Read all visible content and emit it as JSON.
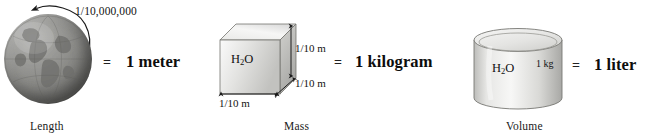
{
  "figure": {
    "background_color": "#ffffff"
  },
  "panels": [
    {
      "id": "length",
      "caption": "Length",
      "icon": "globe-earth",
      "annotation": "1/10,000,000",
      "equals_symbol": "=",
      "result": "1 meter"
    },
    {
      "id": "mass",
      "caption": "Mass",
      "icon": "cube-water",
      "substance": "H",
      "substance_sub": "2",
      "substance_tail": "O",
      "dimension_height": "1/10 m",
      "dimension_depth": "1/10 m",
      "dimension_width": "1/10 m",
      "equals_symbol": "=",
      "result": "1 kilogram"
    },
    {
      "id": "volume",
      "caption": "Volume",
      "icon": "cylinder-water",
      "substance": "H",
      "substance_sub": "2",
      "substance_tail": "O",
      "mass_label": "1 kg",
      "equals_symbol": "=",
      "result": "1 liter"
    }
  ],
  "colors": {
    "ink": "#111111",
    "globe_light": "#b4b4b2",
    "globe_dark": "#4e4e4c",
    "solid_light": "#f2f2f0",
    "solid_mid": "#d8d8d5",
    "solid_dark": "#b3b3b0",
    "stroke": "#555553"
  }
}
